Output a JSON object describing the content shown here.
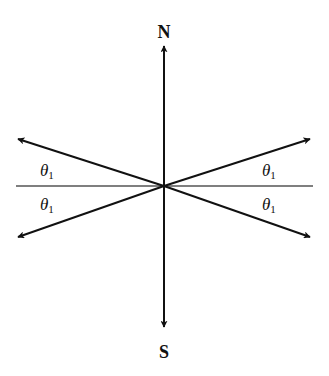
{
  "diagram": {
    "labels": {
      "north": "N",
      "south": "S",
      "theta_symbol": "θ",
      "theta_subscript": "1"
    },
    "angles": [
      {
        "position": "upper-left",
        "symbol": "θ",
        "subscript": "1"
      },
      {
        "position": "lower-left",
        "symbol": "θ",
        "subscript": "1"
      },
      {
        "position": "upper-right",
        "symbol": "θ",
        "subscript": "1"
      },
      {
        "position": "lower-right",
        "symbol": "θ",
        "subscript": "1"
      }
    ],
    "colors": {
      "line": "#111111",
      "reference_line": "#555555",
      "background": "#ffffff"
    }
  }
}
